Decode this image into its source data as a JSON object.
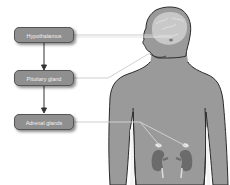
{
  "diagram": {
    "boxes": [
      {
        "label": "Hypothalamus"
      },
      {
        "label": "Pituitary gland"
      },
      {
        "label": "Adrenal glands"
      }
    ],
    "colors": {
      "box_fill": "#8f8f8f",
      "box_border": "#555555",
      "body_fill": "#9a9a9a",
      "outline": "#2a2a2a",
      "kidney": "#6b6b6b",
      "brain": "#c8c8c8",
      "leader_line": "#cfcfcf"
    }
  }
}
